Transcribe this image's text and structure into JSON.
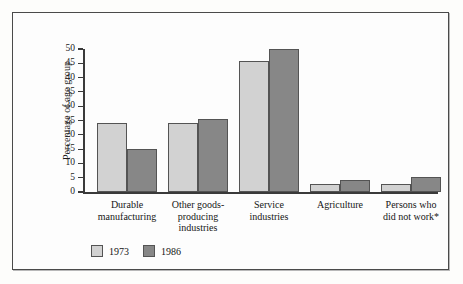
{
  "chart_data": {
    "type": "bar",
    "title": "",
    "xlabel": "",
    "ylabel": "Percentage of age group",
    "ylim": [
      0,
      50
    ],
    "yticks": [
      0,
      5,
      10,
      15,
      20,
      25,
      30,
      35,
      40,
      45,
      50
    ],
    "ytick_labels": [
      "0",
      "5",
      "10",
      "15",
      "20",
      "25",
      "30",
      "35",
      "40",
      "45",
      "50"
    ],
    "grid": false,
    "legend_position": "bottom-left",
    "categories": [
      "Durable\nmanufacturing",
      "Other goods-\nproducing\nindustries",
      "Service\nindustries",
      "Agriculture",
      "Persons who\ndid not work*"
    ],
    "category_lines": [
      [
        "Durable",
        "manufacturing"
      ],
      [
        "Other goods-",
        "producing",
        "industries"
      ],
      [
        "Service",
        "industries"
      ],
      [
        "Agriculture"
      ],
      [
        "Persons who",
        "did not work*"
      ]
    ],
    "series": [
      {
        "name": "1973",
        "color": "#d2d2d2",
        "values": [
          24.0,
          24.2,
          45.8,
          2.8,
          2.9
        ]
      },
      {
        "name": "1986",
        "color": "#878787",
        "values": [
          15.0,
          25.5,
          50.0,
          4.2,
          5.2
        ]
      }
    ]
  },
  "colors": {
    "series_1973": "#d2d2d2",
    "series_1986": "#878787",
    "bar_outline": "#545454",
    "axis": "#3a3a3a",
    "frame": "#4a4a4a",
    "background": "#fdfdfd",
    "text": "#161616"
  }
}
